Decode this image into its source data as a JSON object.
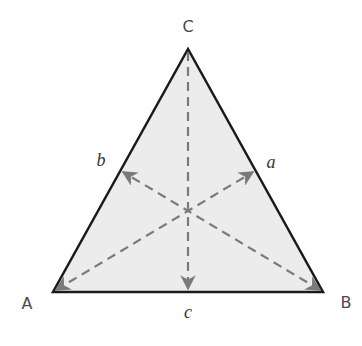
{
  "diagram": {
    "type": "triangle-medians",
    "colors": {
      "fill": "#ececec",
      "edge": "#1a1a1a",
      "median": "#7a7a7a",
      "background": "#ffffff"
    },
    "vertices": [
      {
        "id": "A",
        "label": "A",
        "x": 53,
        "y": 292,
        "label_x": 27,
        "label_y": 304
      },
      {
        "id": "B",
        "label": "B",
        "x": 323,
        "y": 292,
        "label_x": 346,
        "label_y": 303
      },
      {
        "id": "C",
        "label": "C",
        "x": 188,
        "y": 49,
        "label_x": 188,
        "label_y": 27
      }
    ],
    "midpoints": [
      {
        "id": "a",
        "label": "a",
        "side": "BC",
        "x": 255,
        "y": 171,
        "label_x": 271,
        "label_y": 162
      },
      {
        "id": "b",
        "label": "b",
        "side": "CA",
        "x": 121,
        "y": 171,
        "label_x": 101,
        "label_y": 160
      },
      {
        "id": "c",
        "label": "c",
        "side": "AB",
        "x": 188,
        "y": 290,
        "label_x": 188,
        "label_y": 312
      }
    ],
    "centroid": {
      "x": 188,
      "y": 210
    },
    "medians": [
      {
        "from": "A",
        "to": "a"
      },
      {
        "from": "B",
        "to": "b"
      },
      {
        "from": "C",
        "to": "c"
      }
    ]
  }
}
